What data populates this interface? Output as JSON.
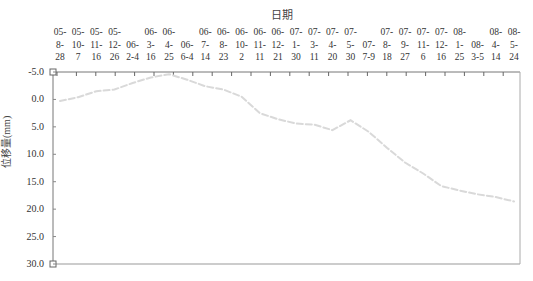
{
  "chart_data": {
    "type": "line",
    "title": "",
    "xlabel": "日期",
    "ylabel": "位移量(mm)",
    "x_axis_position": "top",
    "y_inverted": true,
    "ylim": [
      -5.0,
      30.0
    ],
    "yticks": [
      "-5.0",
      "0.0",
      "5.0",
      "10.0",
      "15.0",
      "20.0",
      "25.0",
      "30.0"
    ],
    "grid": false,
    "legend": null,
    "categories": [
      "05-8-28",
      "05-10-7",
      "05-11-16",
      "05-12-26",
      "06-2-4",
      "06-3-16",
      "06-4-25",
      "06-6-4",
      "06-7-14",
      "06-8-23",
      "06-10-2",
      "06-11-11",
      "06-12-21",
      "07-1-30",
      "07-3-11",
      "07-4-20",
      "07-5-30",
      "07-7-9",
      "07-8-18",
      "07-9-27",
      "07-11-6",
      "07-12-16",
      "08-1-25",
      "08-3-5",
      "08-4-14",
      "08-5-24"
    ],
    "category_labels": [
      [
        "05-",
        "8-",
        "28"
      ],
      [
        "05-",
        "10-",
        "7"
      ],
      [
        "05-",
        "11-",
        "16"
      ],
      [
        "05-",
        "12-",
        "26"
      ],
      [
        "",
        "06-",
        "2-4"
      ],
      [
        "06-",
        "3-",
        "16"
      ],
      [
        "06-",
        "4-",
        "25"
      ],
      [
        "",
        "06-",
        "6-4"
      ],
      [
        "06-",
        "7-",
        "14"
      ],
      [
        "06-",
        "8-",
        "23"
      ],
      [
        "06-",
        "10-",
        "2"
      ],
      [
        "06-",
        "11-",
        "11"
      ],
      [
        "06-",
        "12-",
        "21"
      ],
      [
        "07-",
        "1-",
        "30"
      ],
      [
        "07-",
        "3-",
        "11"
      ],
      [
        "07-",
        "4-",
        "20"
      ],
      [
        "07-",
        "5-",
        "30"
      ],
      [
        "",
        "07-",
        "7-9"
      ],
      [
        "07-",
        "8-",
        "18"
      ],
      [
        "07-",
        "9-",
        "27"
      ],
      [
        "07-",
        "11-",
        "6"
      ],
      [
        "07-",
        "12-",
        "16"
      ],
      [
        "08-",
        "1-",
        "25"
      ],
      [
        "",
        "08-",
        "3-5"
      ],
      [
        "08-",
        "4-",
        "14"
      ],
      [
        "08-",
        "5-",
        "24"
      ]
    ],
    "series": [
      {
        "name": "位移量",
        "color": "#d9d9d9",
        "values": [
          0.3,
          -0.4,
          -1.5,
          -1.8,
          -3.0,
          -4.0,
          -4.6,
          -3.6,
          -2.4,
          -1.8,
          -0.5,
          2.5,
          3.6,
          4.4,
          4.6,
          5.6,
          3.8,
          5.9,
          8.8,
          11.5,
          13.5,
          15.8,
          16.6,
          17.3,
          17.8,
          18.6
        ]
      }
    ]
  }
}
